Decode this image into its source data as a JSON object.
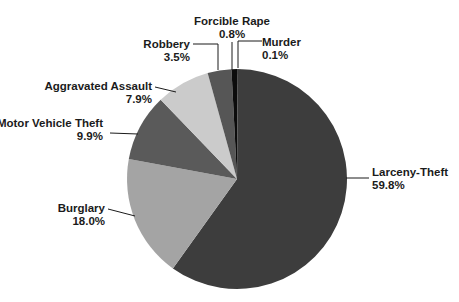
{
  "chart_data": {
    "type": "pie",
    "title": "",
    "legend_position": "callout-labels",
    "direction": "clockwise",
    "start_angle_deg": 0,
    "background_color": "#ffffff",
    "leader_line_color": "#1b1b1b",
    "text_color": "#1b1b1b",
    "slices": [
      {
        "label": "Murder",
        "value": 0.1,
        "pct_label": "0.1%",
        "color": "#000000"
      },
      {
        "label": "Larceny-Theft",
        "value": 59.8,
        "pct_label": "59.8%",
        "color": "#3d3d3d"
      },
      {
        "label": "Burglary",
        "value": 18.0,
        "pct_label": "18.0%",
        "color": "#a4a4a4"
      },
      {
        "label": "Motor Vehicle Theft",
        "value": 9.9,
        "pct_label": "9.9%",
        "color": "#5a5a5a"
      },
      {
        "label": "Aggravated Assault",
        "value": 7.9,
        "pct_label": "7.9%",
        "color": "#cbcbcb"
      },
      {
        "label": "Robbery",
        "value": 3.5,
        "pct_label": "3.5%",
        "color": "#565656"
      },
      {
        "label": "Forcible Rape",
        "value": 0.8,
        "pct_label": "0.8%",
        "color": "#0c0c0c"
      }
    ]
  }
}
